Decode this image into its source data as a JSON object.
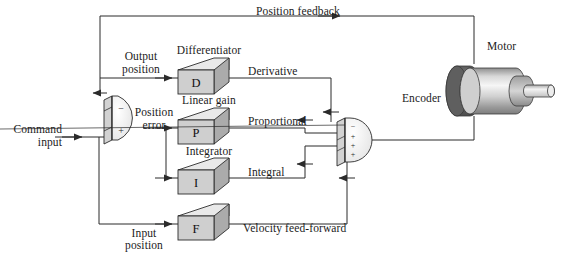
{
  "figure": {
    "background_color": "#ffffff",
    "line_color": "#2b2b2b"
  },
  "labels": {
    "position_feedback": "Position feedback",
    "output_position_line1": "Output",
    "output_position_line2": "position",
    "input_position_line1": "Input",
    "input_position_line2": "position",
    "command_input_line1": "Command",
    "command_input_line2": "input",
    "position_error_line1": "Position",
    "position_error_line2": "error",
    "differentiator": "Differentiator",
    "linear_gain": "Linear gain",
    "integrator": "Integrator",
    "derivative": "Derivative",
    "proportional": "Proportional",
    "integral": "Integral",
    "velocity_feed_forward": "Velocity feed-forward",
    "motor": "Motor",
    "encoder": "Encoder"
  },
  "blocks": [
    {
      "key": "differentiator",
      "letter": "D",
      "caption": "Differentiator",
      "output_label": "Derivative"
    },
    {
      "key": "linear_gain",
      "letter": "P",
      "caption": "Linear gain",
      "output_label": "Proportional"
    },
    {
      "key": "integrator",
      "letter": "I",
      "caption": "Integrator",
      "output_label": "Integral"
    },
    {
      "key": "feed_forward",
      "letter": "F",
      "caption": "",
      "output_label": "Velocity feed-forward"
    }
  ],
  "summing_junctions": [
    {
      "key": "error-junction",
      "name": "error summing junction",
      "signs": [
        "−",
        "+"
      ],
      "inputs": [
        "Output position",
        "Command input"
      ],
      "output": "Position error"
    },
    {
      "key": "output-junction",
      "name": "output summing junction",
      "signs": [
        "−",
        "+",
        "+",
        "+"
      ],
      "inputs": [
        "Derivative",
        "Proportional",
        "Integral",
        "Velocity feed-forward"
      ],
      "output": "Motor drive"
    }
  ],
  "colors": {
    "line": "#2b2b2b",
    "block_face": "#cfcfcf",
    "block_top": "#e8e8e8",
    "block_side": "#a9a9a9",
    "encoder_dark": "#6f6f6f",
    "motor_body_light": "#f2f2f2",
    "motor_body_mid": "#b9b9b9",
    "shaft": "#e4e4e4",
    "text": "#1b1b1b"
  }
}
